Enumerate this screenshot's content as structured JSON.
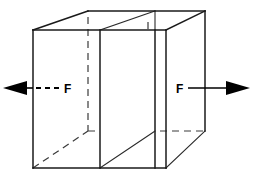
{
  "figure": {
    "background_color": "#ffffff",
    "line_color": "#1a1a1a",
    "hidden_line_color": "#3a3a3a",
    "arrow_color": "#000000"
  },
  "labels": {
    "force_left": "F",
    "force_right": "F"
  },
  "geometry": {
    "front_face": {
      "left_x": 33,
      "right_x": 166,
      "top_y": 30,
      "bottom_y": 168
    },
    "back_face": {
      "left_x": 88,
      "right_x": 205,
      "top_y": 11,
      "bottom_y": 131
    },
    "cut_plane": {
      "front_x": 100,
      "back_x": 155,
      "second_front_x": 148,
      "second_back_x": 166
    }
  },
  "arrows": {
    "left": {
      "name": "force-arrow-left",
      "direction": "left",
      "tip_x": 3,
      "tip_y": 88,
      "tail_x": 60,
      "style": "dashed-shaft"
    },
    "right": {
      "name": "force-arrow-right",
      "direction": "right",
      "tip_x": 250,
      "tip_y": 88,
      "tail_x": 188,
      "style": "solid-shaft"
    }
  }
}
